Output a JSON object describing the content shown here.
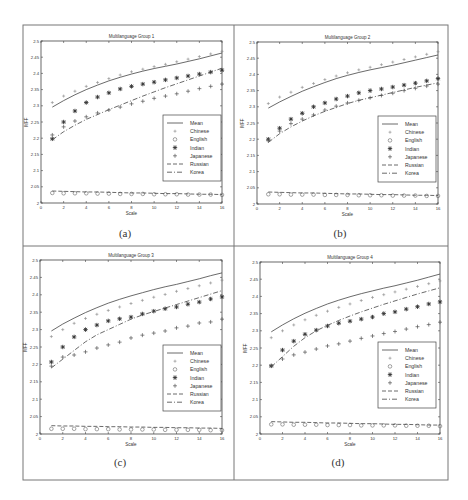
{
  "figure": {
    "captions": [
      "(a)",
      "(b)",
      "(c)",
      "(d)"
    ],
    "frame_color": "#555555",
    "line_color": "#666666"
  },
  "chart_data": [
    {
      "type": "line",
      "panel": "(a)",
      "title": "Multilanguage Group 1",
      "xlabel": "Scale",
      "ylabel": "MFF",
      "xlim": [
        0,
        16
      ],
      "ylim": [
        2,
        2.5
      ],
      "xticks": [
        0,
        2,
        4,
        6,
        8,
        10,
        12,
        14,
        16
      ],
      "yticks": [
        2,
        2.05,
        2.1,
        2.15,
        2.2,
        2.25,
        2.3,
        2.35,
        2.4,
        2.45,
        2.5
      ],
      "ytick_labels": [
        "2",
        "2.05",
        "2.1",
        "2.15",
        "2.2",
        "2.25",
        "2.3",
        "2.35",
        "2.4",
        "2.45",
        "2.5"
      ],
      "legend_position": "center-right",
      "x": [
        1,
        2,
        3,
        4,
        5,
        6,
        7,
        8,
        9,
        10,
        11,
        12,
        13,
        14,
        15,
        16
      ],
      "series": [
        {
          "name": "Mean",
          "style": "solid",
          "values": [
            2.296,
            2.316,
            2.334,
            2.35,
            2.364,
            2.377,
            2.388,
            2.398,
            2.407,
            2.415,
            2.422,
            2.429,
            2.437,
            2.445,
            2.454,
            2.463
          ]
        },
        {
          "name": "Chinese",
          "style": "point",
          "values": [
            2.31,
            2.33,
            2.345,
            2.36,
            2.372,
            2.384,
            2.395,
            2.405,
            2.413,
            2.421,
            2.428,
            2.436,
            2.444,
            2.452,
            2.46,
            2.468
          ]
        },
        {
          "name": "English",
          "style": "circle",
          "values": [
            2.031,
            2.03,
            2.03,
            2.03,
            2.029,
            2.029,
            2.028,
            2.028,
            2.028,
            2.027,
            2.027,
            2.027,
            2.026,
            2.026,
            2.026,
            2.025
          ]
        },
        {
          "name": "Indian",
          "style": "star",
          "values": [
            2.198,
            2.25,
            2.284,
            2.31,
            2.327,
            2.34,
            2.352,
            2.36,
            2.367,
            2.373,
            2.38,
            2.386,
            2.392,
            2.398,
            2.404,
            2.41
          ]
        },
        {
          "name": "Japanese",
          "style": "plus",
          "values": [
            2.21,
            2.235,
            2.253,
            2.266,
            2.278,
            2.287,
            2.296,
            2.306,
            2.314,
            2.323,
            2.33,
            2.337,
            2.345,
            2.353,
            2.36,
            2.367
          ]
        },
        {
          "name": "Russian",
          "style": "dashed",
          "values": [
            2.037,
            2.036,
            2.035,
            2.034,
            2.034,
            2.033,
            2.032,
            2.031,
            2.031,
            2.03,
            2.029,
            2.029,
            2.028,
            2.027,
            2.027,
            2.026
          ]
        },
        {
          "name": "Korea",
          "style": "dashdot",
          "values": [
            2.195,
            2.22,
            2.24,
            2.258,
            2.273,
            2.288,
            2.302,
            2.316,
            2.33,
            2.343,
            2.356,
            2.368,
            2.38,
            2.392,
            2.404,
            2.416
          ]
        }
      ]
    },
    {
      "type": "line",
      "panel": "(b)",
      "title": "Multilanguage Group 2",
      "xlabel": "Scale",
      "ylabel": "MFF",
      "xlim": [
        0,
        16
      ],
      "ylim": [
        2,
        2.5
      ],
      "xticks": [
        0,
        2,
        4,
        6,
        8,
        10,
        12,
        14,
        16
      ],
      "yticks": [
        2,
        2.05,
        2.1,
        2.15,
        2.2,
        2.25,
        2.3,
        2.35,
        2.4,
        2.45,
        2.5
      ],
      "ytick_labels": [
        "2",
        "2.05",
        "2.1",
        "2.15",
        "2.2",
        "2.25",
        "2.3",
        "2.35",
        "2.4",
        "2.45",
        "2.5"
      ],
      "legend_position": "center-right",
      "x": [
        1,
        2,
        3,
        4,
        5,
        6,
        7,
        8,
        9,
        10,
        11,
        12,
        13,
        14,
        15,
        16
      ],
      "series": [
        {
          "name": "Mean",
          "style": "solid",
          "values": [
            2.296,
            2.315,
            2.332,
            2.348,
            2.362,
            2.375,
            2.387,
            2.397,
            2.406,
            2.414,
            2.421,
            2.428,
            2.436,
            2.444,
            2.452,
            2.46
          ]
        },
        {
          "name": "Chinese",
          "style": "point",
          "values": [
            2.31,
            2.33,
            2.345,
            2.36,
            2.372,
            2.384,
            2.395,
            2.405,
            2.414,
            2.422,
            2.43,
            2.438,
            2.446,
            2.454,
            2.462,
            2.47
          ]
        },
        {
          "name": "English",
          "style": "circle",
          "values": [
            2.03,
            2.03,
            2.029,
            2.029,
            2.029,
            2.028,
            2.028,
            2.028,
            2.027,
            2.027,
            2.027,
            2.026,
            2.026,
            2.026,
            2.025,
            2.025
          ]
        },
        {
          "name": "Indian",
          "style": "star",
          "values": [
            2.2,
            2.234,
            2.262,
            2.28,
            2.3,
            2.312,
            2.324,
            2.333,
            2.343,
            2.35,
            2.355,
            2.361,
            2.367,
            2.373,
            2.38,
            2.387
          ]
        },
        {
          "name": "Japanese",
          "style": "plus",
          "values": [
            2.195,
            2.225,
            2.248,
            2.262,
            2.275,
            2.29,
            2.302,
            2.312,
            2.32,
            2.328,
            2.335,
            2.342,
            2.35,
            2.357,
            2.364,
            2.37
          ]
        },
        {
          "name": "Russian",
          "style": "dashed",
          "values": [
            2.037,
            2.036,
            2.035,
            2.034,
            2.034,
            2.033,
            2.032,
            2.031,
            2.031,
            2.03,
            2.029,
            2.029,
            2.028,
            2.027,
            2.027,
            2.026
          ]
        },
        {
          "name": "Korea",
          "style": "dashdot",
          "values": [
            2.19,
            2.217,
            2.238,
            2.256,
            2.272,
            2.286,
            2.298,
            2.31,
            2.32,
            2.328,
            2.336,
            2.344,
            2.352,
            2.36,
            2.367,
            2.374
          ]
        }
      ]
    },
    {
      "type": "line",
      "panel": "(c)",
      "title": "Multilanguage Group 3",
      "xlabel": "Scale",
      "ylabel": "MFF",
      "xlim": [
        0,
        16
      ],
      "ylim": [
        2,
        2.5
      ],
      "xticks": [
        0,
        2,
        4,
        6,
        8,
        10,
        12,
        14,
        16
      ],
      "yticks": [
        2,
        2.05,
        2.1,
        2.15,
        2.2,
        2.25,
        2.3,
        2.35,
        2.4,
        2.45,
        2.5
      ],
      "ytick_labels": [
        "2",
        "2.05",
        "2.1",
        "2.15",
        "2.2",
        "2.25",
        "2.3",
        "2.35",
        "2.4",
        "2.45",
        "2.5"
      ],
      "legend_position": "center-right",
      "x": [
        1,
        2,
        3,
        4,
        5,
        6,
        7,
        8,
        9,
        10,
        11,
        12,
        13,
        14,
        15,
        16
      ],
      "series": [
        {
          "name": "Mean",
          "style": "solid",
          "values": [
            2.296,
            2.316,
            2.333,
            2.349,
            2.363,
            2.376,
            2.387,
            2.397,
            2.406,
            2.415,
            2.423,
            2.43,
            2.438,
            2.446,
            2.455,
            2.463
          ]
        },
        {
          "name": "Chinese",
          "style": "point",
          "values": [
            2.28,
            2.3,
            2.318,
            2.332,
            2.344,
            2.355,
            2.365,
            2.375,
            2.384,
            2.393,
            2.401,
            2.41,
            2.418,
            2.426,
            2.434,
            2.442
          ]
        },
        {
          "name": "English",
          "style": "circle",
          "values": [
            2.015,
            2.015,
            2.015,
            2.014,
            2.014,
            2.014,
            2.013,
            2.013,
            2.013,
            2.013,
            2.012,
            2.012,
            2.012,
            2.012,
            2.011,
            2.011
          ]
        },
        {
          "name": "Indian",
          "style": "star",
          "values": [
            2.207,
            2.25,
            2.279,
            2.3,
            2.313,
            2.325,
            2.331,
            2.336,
            2.345,
            2.353,
            2.36,
            2.365,
            2.373,
            2.379,
            2.388,
            2.394
          ]
        },
        {
          "name": "Japanese",
          "style": "plus",
          "values": [
            2.195,
            2.221,
            2.227,
            2.236,
            2.247,
            2.256,
            2.264,
            2.276,
            2.284,
            2.29,
            2.296,
            2.305,
            2.31,
            2.319,
            2.322,
            2.33
          ]
        },
        {
          "name": "Russian",
          "style": "dashed",
          "values": [
            2.024,
            2.023,
            2.023,
            2.022,
            2.022,
            2.021,
            2.021,
            2.02,
            2.02,
            2.019,
            2.019,
            2.018,
            2.018,
            2.017,
            2.017,
            2.016
          ]
        },
        {
          "name": "Korea",
          "style": "dashdot",
          "values": [
            2.19,
            2.215,
            2.24,
            2.265,
            2.285,
            2.3,
            2.315,
            2.33,
            2.342,
            2.352,
            2.362,
            2.372,
            2.382,
            2.392,
            2.402,
            2.412
          ]
        }
      ]
    },
    {
      "type": "line",
      "panel": "(d)",
      "title": "Multilanguage Group 4",
      "xlabel": "Scale",
      "ylabel": "MFF",
      "xlim": [
        0,
        16
      ],
      "ylim": [
        2,
        2.5
      ],
      "xticks": [
        0,
        2,
        4,
        6,
        8,
        10,
        12,
        14,
        16
      ],
      "yticks": [
        2,
        2.05,
        2.1,
        2.15,
        2.2,
        2.25,
        2.3,
        2.35,
        2.4,
        2.45,
        2.5
      ],
      "ytick_labels": [
        "2",
        "2.05",
        "2.1",
        "2.15",
        "2.2",
        "2.25",
        "2.3",
        "2.35",
        "2.4",
        "2.45",
        "2.5"
      ],
      "legend_position": "center-right",
      "x": [
        1,
        2,
        3,
        4,
        5,
        6,
        7,
        8,
        9,
        10,
        11,
        12,
        13,
        14,
        15,
        16
      ],
      "series": [
        {
          "name": "Mean",
          "style": "solid",
          "values": [
            2.297,
            2.317,
            2.335,
            2.351,
            2.365,
            2.378,
            2.389,
            2.399,
            2.408,
            2.416,
            2.424,
            2.431,
            2.439,
            2.447,
            2.456,
            2.465
          ]
        },
        {
          "name": "Chinese",
          "style": "point",
          "values": [
            2.28,
            2.3,
            2.317,
            2.332,
            2.345,
            2.357,
            2.368,
            2.378,
            2.388,
            2.397,
            2.405,
            2.413,
            2.421,
            2.429,
            2.437,
            2.445
          ]
        },
        {
          "name": "English",
          "style": "circle",
          "values": [
            2.028,
            2.028,
            2.027,
            2.027,
            2.027,
            2.026,
            2.026,
            2.026,
            2.025,
            2.025,
            2.025,
            2.025,
            2.024,
            2.024,
            2.024,
            2.023
          ]
        },
        {
          "name": "Indian",
          "style": "star",
          "values": [
            2.198,
            2.244,
            2.27,
            2.29,
            2.302,
            2.314,
            2.322,
            2.328,
            2.334,
            2.34,
            2.35,
            2.355,
            2.363,
            2.37,
            2.378,
            2.384
          ]
        },
        {
          "name": "Japanese",
          "style": "plus",
          "values": [
            2.198,
            2.218,
            2.23,
            2.238,
            2.247,
            2.256,
            2.262,
            2.27,
            2.278,
            2.285,
            2.292,
            2.298,
            2.305,
            2.312,
            2.318,
            2.325
          ]
        },
        {
          "name": "Russian",
          "style": "dashed",
          "values": [
            2.036,
            2.035,
            2.034,
            2.034,
            2.033,
            2.032,
            2.032,
            2.031,
            2.03,
            2.03,
            2.029,
            2.028,
            2.028,
            2.027,
            2.026,
            2.026
          ]
        },
        {
          "name": "Korea",
          "style": "dashdot",
          "values": [
            2.195,
            2.225,
            2.255,
            2.28,
            2.3,
            2.316,
            2.33,
            2.343,
            2.355,
            2.366,
            2.377,
            2.387,
            2.397,
            2.407,
            2.416,
            2.425
          ]
        }
      ]
    }
  ]
}
